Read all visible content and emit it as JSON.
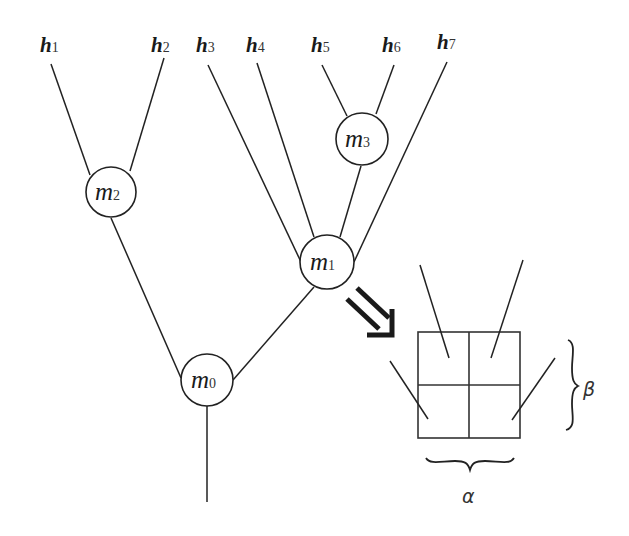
{
  "diagram": {
    "title": "",
    "leaves": [
      {
        "id": "h1",
        "base": "h",
        "sub": "1",
        "x": 40,
        "y": 52
      },
      {
        "id": "h2",
        "base": "h",
        "sub": "2",
        "x": 151,
        "y": 52
      },
      {
        "id": "h3",
        "base": "h",
        "sub": "3",
        "x": 196,
        "y": 52
      },
      {
        "id": "h4",
        "base": "h",
        "sub": "4",
        "x": 246,
        "y": 52
      },
      {
        "id": "h5",
        "base": "h",
        "sub": "5",
        "x": 311,
        "y": 52
      },
      {
        "id": "h6",
        "base": "h",
        "sub": "6",
        "x": 382,
        "y": 52
      },
      {
        "id": "h7",
        "base": "h",
        "sub": "7",
        "x": 437,
        "y": 49
      }
    ],
    "nodes": [
      {
        "id": "m0",
        "base": "m",
        "sub": "0",
        "cx": 207,
        "cy": 380,
        "r": 26
      },
      {
        "id": "m1",
        "base": "m",
        "sub": "1",
        "cx": 327,
        "cy": 262,
        "r": 27
      },
      {
        "id": "m2",
        "base": "m",
        "sub": "2",
        "cx": 111,
        "cy": 192,
        "r": 25
      },
      {
        "id": "m3",
        "base": "m",
        "sub": "3",
        "cx": 362,
        "cy": 139,
        "r": 26
      }
    ],
    "edges": [
      {
        "from": "h1",
        "to": "m2"
      },
      {
        "from": "h2",
        "to": "m2"
      },
      {
        "from": "h3",
        "to": "m1"
      },
      {
        "from": "h4",
        "to": "m1"
      },
      {
        "from": "h5",
        "to": "m3"
      },
      {
        "from": "h6",
        "to": "m3"
      },
      {
        "from": "h7",
        "to": "m1"
      },
      {
        "from": "m3",
        "to": "m1"
      },
      {
        "from": "m2",
        "to": "m0"
      },
      {
        "from": "m1",
        "to": "m0"
      },
      {
        "from": "m0",
        "to": "output"
      }
    ],
    "expansion": {
      "of": "m1",
      "arrow": "double-arrow-icon",
      "grid": {
        "rows": 2,
        "cols": 2
      },
      "alpha_label": "α",
      "beta_label": "β"
    }
  }
}
